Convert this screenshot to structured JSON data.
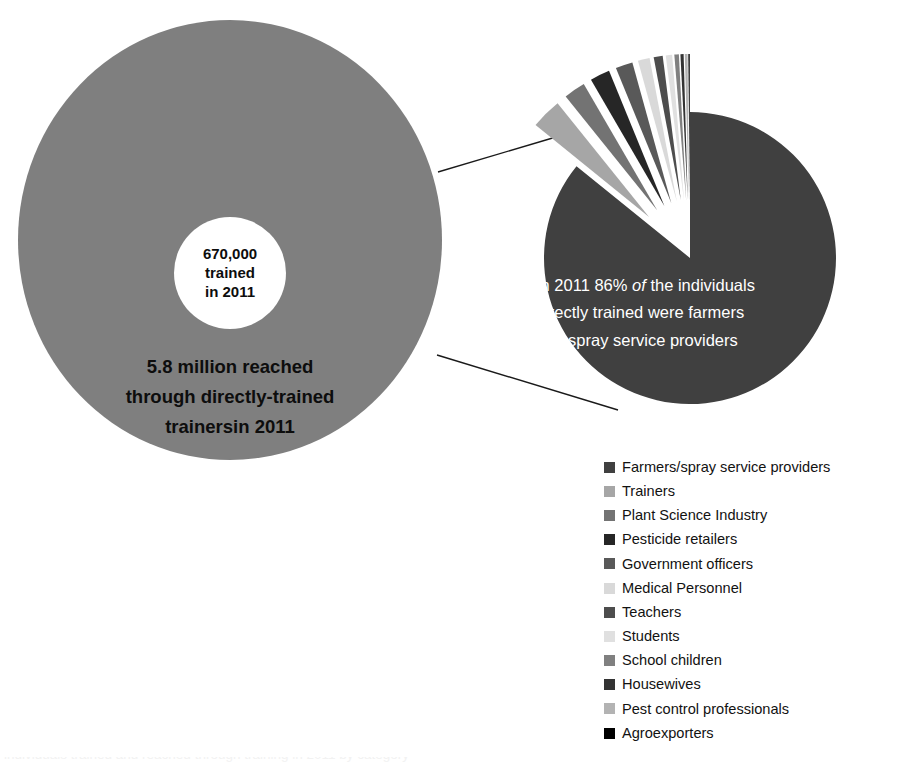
{
  "figure": {
    "width": 906,
    "height": 771,
    "background": "#ffffff"
  },
  "donut": {
    "fill_color": "#7f7f7f",
    "hole_color": "#ffffff",
    "center_lines": [
      "670,000",
      "trained",
      "in 2011"
    ],
    "caption_lines": [
      "5.8 million reached",
      "through directly-trained",
      "trainersin 2011"
    ]
  },
  "pie_callout": {
    "line1_a": "In 2011 86% ",
    "line1_italic": "of",
    "line1_b": " the individuals",
    "line2": "directly trained were farmers",
    "line3": "and spray service providers",
    "text_color": "#ffffff"
  },
  "legend": {
    "items": [
      {
        "label": "Farmers/spray service providers",
        "color": "#404040"
      },
      {
        "label": "Trainers",
        "color": "#a6a6a6"
      },
      {
        "label": "Plant Science Industry",
        "color": "#737373"
      },
      {
        "label": "Pesticide retailers",
        "color": "#262626"
      },
      {
        "label": "Government officers",
        "color": "#595959"
      },
      {
        "label": "Medical Personnel",
        "color": "#d9d9d9"
      },
      {
        "label": "Teachers",
        "color": "#4d4d4d"
      },
      {
        "label": "Students",
        "color": "#e0e0e0"
      },
      {
        "label": "School children",
        "color": "#808080"
      },
      {
        "label": "Housewives",
        "color": "#333333"
      },
      {
        "label": "Pest control professionals",
        "color": "#b3b3b3"
      },
      {
        "label": "Agroexporters",
        "color": "#000000"
      }
    ]
  },
  "bottom_caption": {
    "text": "individuals trained and reached through training in 2011 by category"
  },
  "chart_data": {
    "type": "pie",
    "xlabel": "",
    "ylabel": "",
    "grid": false,
    "legend_position": "bottom-right",
    "annotations": [
      "670,000 trained in 2011",
      "5.8 million reached through directly-trained trainersin 2011",
      "In 2011 86% of the individuals directly trained were farmers and spray service providers"
    ],
    "labels": [
      "Farmers/spray service providers",
      "Trainers",
      "Plant Science Industry",
      "Pesticide retailers",
      "Government officers",
      "Medical Personnel",
      "Teachers",
      "Students",
      "School children",
      "Housewives",
      "Pest control professionals",
      "Agroexporters"
    ],
    "values": [
      86.0,
      3.4,
      2.4,
      2.2,
      1.9,
      1.3,
      1.0,
      0.7,
      0.5,
      0.35,
      0.3,
      0.15
    ],
    "colors": [
      "#404040",
      "#a6a6a6",
      "#737373",
      "#262626",
      "#595959",
      "#d9d9d9",
      "#4d4d4d",
      "#e0e0e0",
      "#808080",
      "#333333",
      "#b3b3b3",
      "#000000"
    ],
    "exploded": [
      false,
      true,
      true,
      true,
      true,
      true,
      true,
      true,
      true,
      true,
      true,
      true
    ],
    "geometry": {
      "center_x": 220,
      "center_y": 248,
      "radius": 146,
      "explode_offset": 58,
      "start_angle_deg": -90
    },
    "secondary": {
      "type": "donut",
      "label": "Reach multiplier",
      "center_value": "670,000 trained in 2011",
      "outer_value": "5.8 million reached through directly-trained trainersin 2011"
    }
  }
}
